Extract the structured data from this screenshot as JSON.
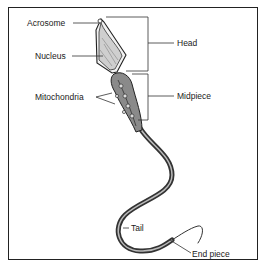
{
  "diagram": {
    "type": "labeled anatomical illustration",
    "labels": {
      "acrosome": "Acrosome",
      "nucleus": "Nucleus",
      "mitochondria": "Mitochondria",
      "head": "Head",
      "midpiece": "Midpiece",
      "tail": "Tail",
      "end_piece": "End piece"
    },
    "colors": {
      "line": "#222222",
      "fill_head": "#d9d9d9",
      "fill_midpiece": "#9a9a9a",
      "background": "#ffffff"
    }
  }
}
